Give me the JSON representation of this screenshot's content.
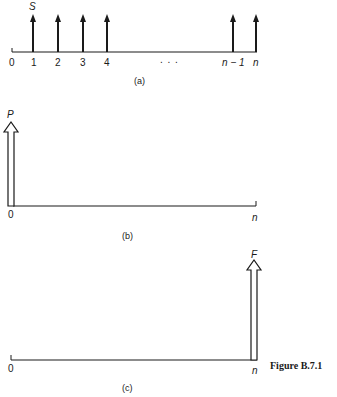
{
  "panel_a": {
    "caption": "(a)",
    "arrow_label": "S",
    "ticks": [
      "0",
      "1",
      "2",
      "3",
      "4",
      "n − 1",
      "n"
    ],
    "ellipsis": ". . ."
  },
  "panel_b": {
    "caption": "(b)",
    "arrow_label": "P",
    "start_label": "0",
    "end_label": "n"
  },
  "panel_c": {
    "caption": "(c)",
    "arrow_label": "F",
    "start_label": "0",
    "end_label": "n"
  },
  "figure_label": "Figure B.7.1",
  "colors": {
    "ink": "#1a1a1a",
    "background": "#ffffff"
  }
}
